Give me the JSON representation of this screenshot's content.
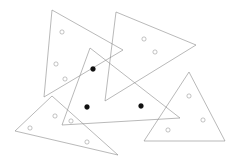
{
  "figure": {
    "width": 240,
    "height": 165,
    "background_color": "#ffffff",
    "outline_color": "#8a8a8a",
    "outline_width": 0.6,
    "marker_open_color": "#9a9a9a",
    "marker_filled_color": "#101010",
    "shape_count_label": "5",
    "marker_count_label": "14",
    "filled_marker_count_label": "3"
  },
  "chart_data": {
    "type": "scatter",
    "xlabel": "",
    "ylabel": "",
    "xlim": [
      0,
      240
    ],
    "ylim": [
      0,
      165
    ],
    "grid": false,
    "legend": null,
    "shapes": [
      {
        "id": "triangle-1",
        "label": "large-left-triangle",
        "kind": "triangle",
        "points": "52,10 123,50 44,97",
        "stroke": "#8a8a8a"
      },
      {
        "id": "triangle-2",
        "label": "upper-right-arrow-triangle",
        "kind": "triangle",
        "points": "116,12 196,45 105,101",
        "stroke": "#8a8a8a"
      },
      {
        "id": "triangle-3",
        "label": "center-tilted-triangle",
        "kind": "triangle",
        "points": "90,48 180,118 62,125",
        "stroke": "#8a8a8a"
      },
      {
        "id": "triangle-4",
        "label": "bottom-left-wide-triangle",
        "kind": "triangle",
        "points": "52,96 118,155 15,131",
        "stroke": "#8a8a8a"
      },
      {
        "id": "triangle-5",
        "label": "bottom-right-triangle",
        "kind": "triangle",
        "points": "189,72 225,141 144,141",
        "stroke": "#8a8a8a"
      }
    ],
    "markers": [
      {
        "id": "m1",
        "x": 62,
        "y": 32,
        "style": "open",
        "r": 2.1
      },
      {
        "id": "m2",
        "x": 56,
        "y": 64,
        "style": "open",
        "r": 2.1
      },
      {
        "id": "m3",
        "x": 65,
        "y": 79,
        "style": "open",
        "r": 2.1
      },
      {
        "id": "m4",
        "x": 144,
        "y": 39,
        "style": "open",
        "r": 2.1
      },
      {
        "id": "m5",
        "x": 155,
        "y": 52,
        "style": "open",
        "r": 2.1
      },
      {
        "id": "m6",
        "x": 93,
        "y": 69,
        "style": "filled",
        "r": 2.4
      },
      {
        "id": "m7",
        "x": 87,
        "y": 107,
        "style": "filled",
        "r": 2.4
      },
      {
        "id": "m8",
        "x": 141,
        "y": 106,
        "style": "filled",
        "r": 2.4
      },
      {
        "id": "m9",
        "x": 55,
        "y": 116,
        "style": "open",
        "r": 2.1
      },
      {
        "id": "m10",
        "x": 71,
        "y": 121,
        "style": "open",
        "r": 2.1
      },
      {
        "id": "m11",
        "x": 30,
        "y": 128,
        "style": "open",
        "r": 2.1
      },
      {
        "id": "m12",
        "x": 87,
        "y": 142,
        "style": "open",
        "r": 2.1
      },
      {
        "id": "m13",
        "x": 189,
        "y": 96,
        "style": "open",
        "r": 2.1
      },
      {
        "id": "m14",
        "x": 203,
        "y": 120,
        "style": "open",
        "r": 2.1
      },
      {
        "id": "m15",
        "x": 168,
        "y": 130,
        "style": "open",
        "r": 2.1
      }
    ]
  }
}
